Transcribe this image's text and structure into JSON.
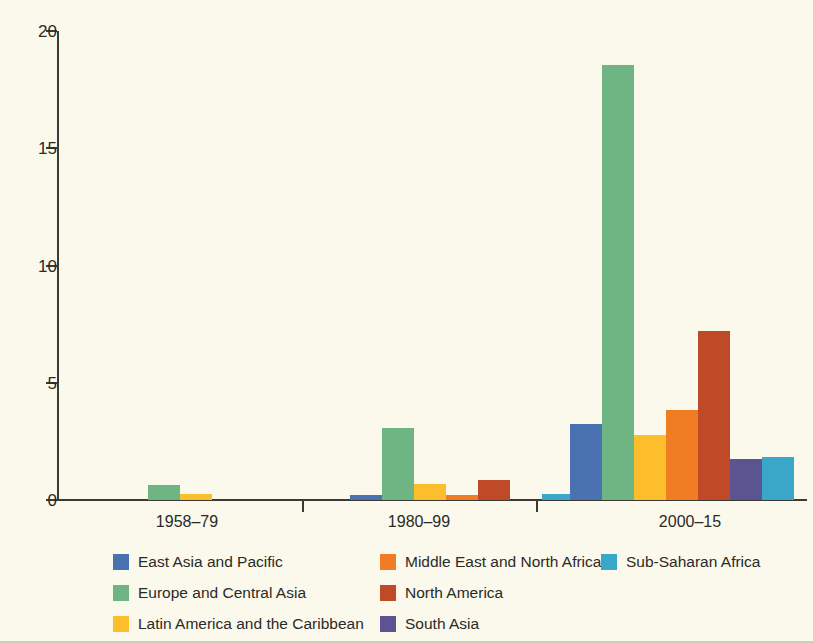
{
  "figure": {
    "background_color": "#fbf9ec",
    "axis_color": "#3b3a35"
  },
  "chart_data": {
    "type": "bar",
    "title": "",
    "subtitle": "",
    "xlabel": "",
    "ylabel": "",
    "grid": false,
    "legend_position": "bottom",
    "ylim": [
      0,
      20
    ],
    "yticks": [
      0,
      5,
      10,
      15,
      20
    ],
    "ytick_labels": [
      "0",
      "5",
      "10",
      "15",
      "20"
    ],
    "categories": [
      "1958–79",
      "1980–99",
      "2000–15"
    ],
    "series": [
      {
        "name": "East Asia and Pacific",
        "color": "#4a72b0",
        "values": [
          0,
          0.2,
          3.25
        ]
      },
      {
        "name": "Europe and Central Asia",
        "color": "#6fb584",
        "values": [
          0.65,
          3.05,
          18.55
        ]
      },
      {
        "name": "Latin America and the Caribbean",
        "color": "#fcbe2b",
        "values": [
          0.25,
          0.7,
          2.78
        ]
      },
      {
        "name": "Middle East and North Africa",
        "color": "#f07c24",
        "values": [
          0,
          0.2,
          3.85
        ]
      },
      {
        "name": "North America",
        "color": "#c04a28",
        "values": [
          0,
          0.85,
          7.2
        ]
      },
      {
        "name": "South Asia",
        "color": "#5b5491",
        "values": [
          0,
          0,
          1.75
        ]
      },
      {
        "name": "Sub-Saharan Africa",
        "color": "#3ba7c8",
        "values": [
          0,
          0.25,
          1.85
        ]
      }
    ]
  },
  "legend": {
    "columns": [
      [
        {
          "label": "East Asia and Pacific",
          "color": "#4a72b0"
        },
        {
          "label": "Europe and Central Asia",
          "color": "#6fb584"
        },
        {
          "label": "Latin America and the Caribbean",
          "color": "#fcbe2b"
        }
      ],
      [
        {
          "label": "Middle East and North Africa",
          "color": "#f07c24"
        },
        {
          "label": "North America",
          "color": "#c04a28"
        },
        {
          "label": "South Asia",
          "color": "#5b5491"
        }
      ],
      [
        {
          "label": "Sub-Saharan Africa",
          "color": "#3ba7c8"
        }
      ]
    ]
  }
}
